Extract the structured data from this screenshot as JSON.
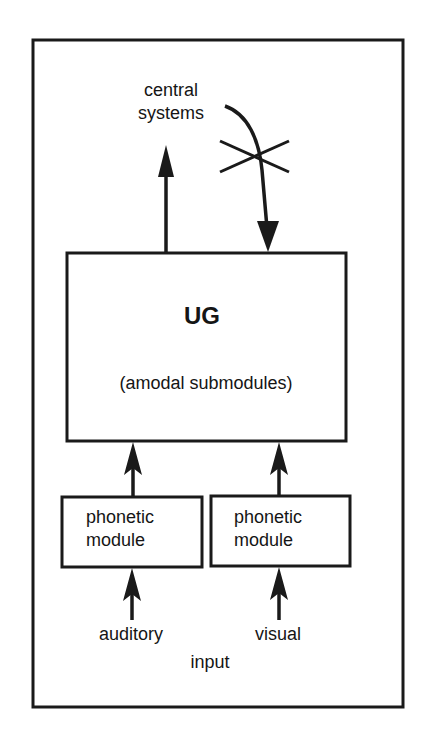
{
  "diagram": {
    "type": "block-diagram",
    "colors": {
      "stroke": "#1a1a1a",
      "background": "#ffffff",
      "text": "#151515"
    },
    "central_systems": {
      "line1": "central",
      "line2": "systems"
    },
    "ug_box": {
      "title": "UG",
      "subtitle": "(amodal submodules)"
    },
    "phonetic_modules": [
      {
        "line1": "phonetic",
        "line2": "module"
      },
      {
        "line1": "phonetic",
        "line2": "module"
      }
    ],
    "inputs": {
      "auditory": "auditory",
      "visual": "visual",
      "group_label": "input"
    },
    "edges": [
      {
        "from": "UG",
        "to": "central systems",
        "blocked": false
      },
      {
        "from": "central systems",
        "to": "UG",
        "blocked": true
      },
      {
        "from": "phonetic module (auditory)",
        "to": "UG",
        "blocked": false
      },
      {
        "from": "phonetic module (visual)",
        "to": "UG",
        "blocked": false
      },
      {
        "from": "auditory",
        "to": "phonetic module (auditory)",
        "blocked": false
      },
      {
        "from": "visual",
        "to": "phonetic module (visual)",
        "blocked": false
      }
    ]
  }
}
